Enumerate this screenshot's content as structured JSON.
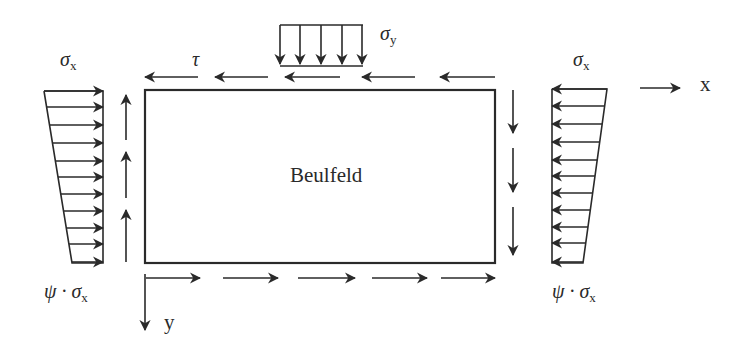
{
  "diagram": {
    "panel_label": "Beulfeld",
    "colors": {
      "stroke": "#2a2a2a",
      "background": "#ffffff"
    },
    "labels": {
      "sigma_x_left": {
        "symbol": "σ",
        "subscript": "x"
      },
      "sigma_x_right": {
        "symbol": "σ",
        "subscript": "x"
      },
      "sigma_y": {
        "symbol": "σ",
        "subscript": "y"
      },
      "tau": {
        "symbol": "τ"
      },
      "psi_sigma_left": {
        "prefix": "ψ · ",
        "symbol": "σ",
        "subscript": "x"
      },
      "psi_sigma_right": {
        "prefix": "ψ · ",
        "symbol": "σ",
        "subscript": "x"
      },
      "axis_x": "x",
      "axis_y": "y"
    },
    "loads": {
      "left_compression_arrows": 11,
      "right_compression_arrows": 11,
      "top_shear_arrows": 5,
      "bottom_shear_arrows": 5,
      "left_shear_arrows": 3,
      "right_shear_arrows": 3,
      "sigma_y_arrows": 5
    }
  }
}
